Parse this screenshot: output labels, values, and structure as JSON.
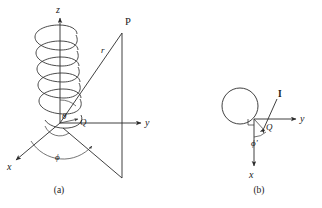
{
  "figure": {
    "background_color": "#ffffff",
    "ink_color": "#2b2b2b",
    "panels": [
      {
        "id": "a",
        "caption": "(a)",
        "description": "Helical coil along the z axis with spherical coordinates to field point P",
        "axes": [
          {
            "name": "z",
            "label": "z",
            "direction": "up"
          },
          {
            "name": "y",
            "label": "y",
            "direction": "right"
          },
          {
            "name": "x",
            "label": "x",
            "direction": "lower-left"
          }
        ],
        "labels": {
          "point": "P",
          "radius": "r",
          "polar_angle": "θ",
          "azimuth_angle": "ϕ",
          "source_point": "Q"
        },
        "coil_turns": 5
      },
      {
        "id": "b",
        "caption": "(b)",
        "description": "Top view of the circular current loop in the x-y plane",
        "axes": [
          {
            "name": "y",
            "label": "y",
            "direction": "right"
          },
          {
            "name": "x",
            "label": "x",
            "direction": "down"
          }
        ],
        "labels": {
          "current": "I",
          "source_point": "Q",
          "source_azimuth": "ϕ'"
        },
        "right_angle_marker": true
      }
    ]
  }
}
